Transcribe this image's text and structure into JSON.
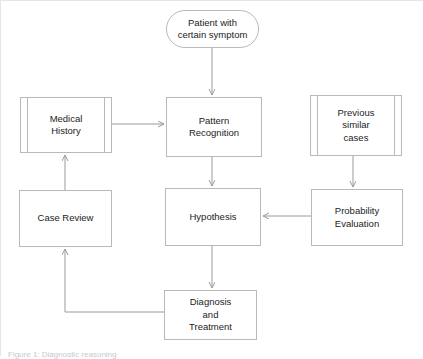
{
  "figure": {
    "caption": "Figure 1: Diagnostic reasoning",
    "background_color": "#ffffff",
    "stroke_color": "#b9b9b9",
    "text_color": "#1c1c1c"
  },
  "nodes": [
    {
      "id": "patient",
      "label": "Patient with\ncertain symptom",
      "shape": "terminator",
      "x": 166,
      "y": 10,
      "w": 93,
      "h": 38
    },
    {
      "id": "medical_history",
      "label": "Medical\nHistory",
      "shape": "predefined-process",
      "x": 20,
      "y": 97,
      "w": 92,
      "h": 56
    },
    {
      "id": "pattern_recognition",
      "label": "Pattern\nRecognition",
      "shape": "process",
      "x": 166,
      "y": 97,
      "w": 96,
      "h": 60
    },
    {
      "id": "previous_cases",
      "label": "Previous\nsimilar\ncases",
      "shape": "predefined-process",
      "x": 310,
      "y": 95,
      "w": 92,
      "h": 61
    },
    {
      "id": "case_review",
      "label": "Case Review",
      "shape": "process",
      "x": 19,
      "y": 190,
      "w": 93,
      "h": 57
    },
    {
      "id": "hypothesis",
      "label": "Hypothesis",
      "shape": "process",
      "x": 165,
      "y": 188,
      "w": 96,
      "h": 58
    },
    {
      "id": "probability_evaluation",
      "label": "Probability\nEvaluation",
      "shape": "process",
      "x": 311,
      "y": 189,
      "w": 92,
      "h": 57
    },
    {
      "id": "diagnosis_treatment",
      "label": "Diagnosis\nand\nTreatment",
      "shape": "process",
      "x": 164,
      "y": 290,
      "w": 93,
      "h": 50
    }
  ],
  "edges": [
    {
      "id": "patient-to-pattern",
      "from": "patient",
      "to": "pattern_recognition",
      "direction": "down"
    },
    {
      "id": "history-to-pattern",
      "from": "medical_history",
      "to": "pattern_recognition",
      "direction": "right"
    },
    {
      "id": "pattern-to-hypothesis",
      "from": "pattern_recognition",
      "to": "hypothesis",
      "direction": "down"
    },
    {
      "id": "cases-to-probability",
      "from": "previous_cases",
      "to": "probability_evaluation",
      "direction": "down"
    },
    {
      "id": "probability-to-hypothesis",
      "from": "probability_evaluation",
      "to": "hypothesis",
      "direction": "left"
    },
    {
      "id": "hypothesis-to-diagnosis",
      "from": "hypothesis",
      "to": "diagnosis_treatment",
      "direction": "down"
    },
    {
      "id": "diagnosis-to-case-review",
      "from": "diagnosis_treatment",
      "to": "case_review",
      "direction": "left-then-up"
    },
    {
      "id": "case-review-to-history",
      "from": "case_review",
      "to": "medical_history",
      "direction": "up"
    }
  ]
}
